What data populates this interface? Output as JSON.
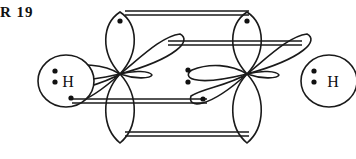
{
  "figure": {
    "caption_fragment": "R  19",
    "molecule": "C2H2",
    "stroke_color": "#1a1a1a",
    "fill_color": "#ffffff",
    "background": "#ffffff"
  },
  "atoms": [
    {
      "id": "h-left",
      "label": "H",
      "x": 66,
      "y": 81,
      "rx": 28,
      "ry": 26
    },
    {
      "id": "h-right",
      "label": "H",
      "x": 329,
      "y": 81,
      "rx": 28,
      "ry": 26
    }
  ],
  "carbons": [
    {
      "id": "carbon-left",
      "x": 120,
      "y": 74
    },
    {
      "id": "carbon-right",
      "x": 247,
      "y": 74
    }
  ],
  "electron_pairs": [
    {
      "id": "pair-h-left-sigma",
      "x": 55,
      "y": 76,
      "count": 2
    },
    {
      "id": "pair-c-c-sigma",
      "x": 188,
      "y": 76,
      "count": 2
    },
    {
      "id": "pair-h-right-sigma",
      "x": 314,
      "y": 76,
      "count": 2
    }
  ],
  "single_electrons": [
    {
      "id": "electron-top-left",
      "x": 120,
      "y": 21
    },
    {
      "id": "electron-top-right",
      "x": 247,
      "y": 21
    },
    {
      "id": "electron-lower-left-lobe",
      "x": 71,
      "y": 98
    },
    {
      "id": "electron-lower-right-lobe",
      "x": 203,
      "y": 99
    }
  ],
  "pi_bond_lines": [
    {
      "id": "pi-line-top",
      "x1": 125,
      "y1": 13,
      "x2": 249,
      "y2": 13
    },
    {
      "id": "pi-line-upper-middle",
      "x1": 170,
      "y1": 43,
      "x2": 300,
      "y2": 43
    },
    {
      "id": "pi-line-lower-middle",
      "x1": 75,
      "y1": 101,
      "x2": 205,
      "y2": 101
    },
    {
      "id": "pi-line-bottom",
      "x1": 125,
      "y1": 134,
      "x2": 249,
      "y2": 134
    }
  ],
  "orbital_lobes": [
    {
      "id": "lobe-left-up",
      "center": "carbon-left",
      "direction": "up"
    },
    {
      "id": "lobe-left-down",
      "center": "carbon-left",
      "direction": "down"
    },
    {
      "id": "lobe-left-upper-right",
      "center": "carbon-left",
      "direction": "upper-right"
    },
    {
      "id": "lobe-left-lower-left",
      "center": "carbon-left",
      "direction": "lower-left"
    },
    {
      "id": "lobe-left-sigma-h",
      "center": "carbon-left",
      "direction": "left"
    },
    {
      "id": "lobe-left-sigma-c",
      "center": "carbon-left",
      "direction": "right"
    },
    {
      "id": "lobe-right-up",
      "center": "carbon-right",
      "direction": "up"
    },
    {
      "id": "lobe-right-down",
      "center": "carbon-right",
      "direction": "down"
    },
    {
      "id": "lobe-right-upper-right",
      "center": "carbon-right",
      "direction": "upper-right"
    },
    {
      "id": "lobe-right-lower-left",
      "center": "carbon-right",
      "direction": "lower-left"
    },
    {
      "id": "lobe-right-sigma-c",
      "center": "carbon-right",
      "direction": "left"
    },
    {
      "id": "lobe-right-sigma-h",
      "center": "carbon-right",
      "direction": "right"
    }
  ]
}
